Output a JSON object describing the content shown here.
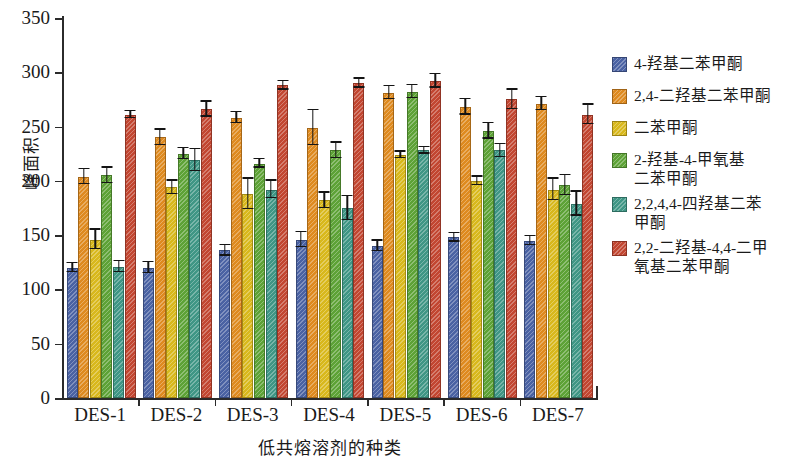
{
  "chart_data": {
    "type": "bar",
    "title": "",
    "xlabel": "低共熔溶剂的种类",
    "ylabel": "峰面积",
    "categories": [
      "DES-1",
      "DES-2",
      "DES-3",
      "DES-4",
      "DES-5",
      "DES-6",
      "DES-7"
    ],
    "ylim": [
      0,
      350
    ],
    "yticks": [
      0,
      50,
      100,
      150,
      200,
      250,
      300,
      350
    ],
    "grid": false,
    "legend_position": "right",
    "error_bars": true,
    "series": [
      {
        "name": "4-羟基二苯甲酮",
        "color": "#4A62A3",
        "values": [
          120,
          120,
          136,
          146,
          140,
          148,
          145
        ],
        "errors": [
          4,
          5,
          5,
          7,
          5,
          4,
          4
        ]
      },
      {
        "name": "2,4-二羟基二苯甲酮",
        "color": "#DE8A1F",
        "values": [
          204,
          240,
          258,
          249,
          281,
          268,
          271
        ],
        "errors": [
          7,
          7,
          5,
          16,
          6,
          7,
          6
        ]
      },
      {
        "name": "二苯甲酮",
        "color": "#D8B81C",
        "values": [
          146,
          194,
          188,
          182,
          224,
          200,
          192
        ],
        "errors": [
          9,
          6,
          14,
          7,
          3,
          4,
          10
        ]
      },
      {
        "name": "2-羟基-4-甲氧基\n二苯甲酮",
        "color": "#5DA236",
        "values": [
          205,
          225,
          216,
          228,
          282,
          246,
          196
        ],
        "errors": [
          7,
          5,
          4,
          7,
          6,
          7,
          9
        ]
      },
      {
        "name": "2,2,4,4-四羟基二苯\n甲酮",
        "color": "#3F9685",
        "values": [
          121,
          219,
          192,
          175,
          228,
          228,
          179
        ],
        "errors": [
          5,
          10,
          8,
          11,
          3,
          6,
          11
        ]
      },
      {
        "name": "2,2-二羟基-4,4-二甲\n氧基二苯甲酮",
        "color": "#C24631",
        "values": [
          261,
          266,
          288,
          290,
          292,
          275,
          261
        ],
        "errors": [
          3,
          7,
          4,
          4,
          6,
          9,
          9
        ]
      }
    ]
  }
}
